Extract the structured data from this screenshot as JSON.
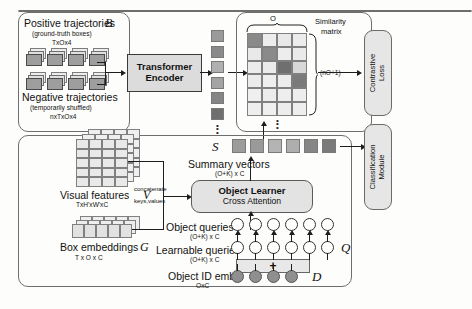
{
  "figure": {
    "type": "diagram"
  },
  "panels": {
    "top": {
      "name": "contrastive-branch"
    },
    "bottom": {
      "name": "object-learner-branch"
    }
  },
  "top_branch": {
    "positive": {
      "label": "Positive trajectories",
      "symbol": "B",
      "sub": "(ground-truth boxes)",
      "dims": "TxOx4",
      "count": 4
    },
    "negative": {
      "label": "Negative trajectories",
      "sub": "(temporarily shuffled)",
      "dims": "nxTxOx4",
      "count": 4
    },
    "encoder": {
      "line1": "Transformer",
      "line2": "Encoder"
    },
    "token_column": {
      "count": 6,
      "shades": [
        "#9a9a9a",
        "#8a8a8a",
        "#b0b0b0",
        "#a4a4a4",
        "#858585",
        "#6f6f6f"
      ]
    },
    "matrix": {
      "label_line1": "Similarity",
      "label_line2": "matrix",
      "top_label": "O",
      "right_label": "(nO+1)",
      "cols": 4,
      "rows": 6,
      "cells": [
        [
          "#8a8a8a",
          "#ededed",
          "#e9e9e9",
          "#ececec"
        ],
        [
          "#e9e9e9",
          "#8a8a8a",
          "#ededed",
          "#eaeaea"
        ],
        [
          "#ececec",
          "#ebebeb",
          "#6f6f6f",
          "#d8d8d8"
        ],
        [
          "#ebebeb",
          "#eeeeee",
          "#ececec",
          "#7a7a7a"
        ],
        [
          "#efefef",
          "#ececec",
          "#eeeeee",
          "#ededed"
        ],
        [
          "#eeeeee",
          "#efefef",
          "#ededed",
          "#eeeeee"
        ]
      ]
    },
    "contrastive_loss": {
      "line1": "Contrastive",
      "line2": "Loss"
    }
  },
  "bottom_branch": {
    "visual_features": {
      "label": "Visual features",
      "symbol": "V",
      "dims": "TxH'xW'xC",
      "grid_cols": 4,
      "grid_rows": 5,
      "layers": 3
    },
    "box_embeddings": {
      "label": "Box embeddings",
      "symbol": "G",
      "dims": "T x O x C",
      "cols": 5,
      "layers": 3
    },
    "concatenate": {
      "line1": "concatenate",
      "line2": "keys,values"
    },
    "object_learner": {
      "line1": "Object Learner",
      "line2": "Cross Attention"
    },
    "summary_vectors": {
      "label": "Summary vectors",
      "dims": "(O+K) x C",
      "symbol": "S",
      "count": 6,
      "shades": [
        "#9c9c9c",
        "#9a9a9a",
        "#b4b4b4",
        "#aeaeae",
        "#868686",
        "#7a7a7a"
      ]
    },
    "object_queries": {
      "label": "Object queries",
      "dims": "(O+K) x C",
      "count": 6
    },
    "learnable_queries": {
      "label": "Learnable queries",
      "dims": "(O+K) x C",
      "symbol": "Q",
      "count": 6
    },
    "object_id_embs": {
      "label": "Object ID embs",
      "dims": "OxC",
      "symbol": "D",
      "count": 4
    },
    "plus": "+",
    "classification_module": {
      "line1": "Classification",
      "line2": "Module"
    }
  },
  "colors": {
    "ink": "#111111",
    "line": "#1d1d1d",
    "panel_border": "#6e6e6e",
    "proc_fill": "#dcdcdc",
    "round_fill": "#e3e3e3"
  }
}
